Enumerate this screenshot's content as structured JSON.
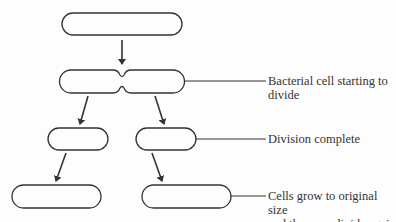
{
  "diagram": {
    "title": "",
    "stages": [
      {
        "id": "original-cell",
        "label": ""
      },
      {
        "id": "dividing-cell",
        "label": "Bacterial cell starting to divide"
      },
      {
        "id": "daughter-cells",
        "label": "Division complete"
      },
      {
        "id": "grown-cells",
        "label": "Cells grow to original size and then can divide again"
      }
    ],
    "labels": {
      "dividing_line1": "Bacterial cell starting to",
      "dividing_line2": "divide",
      "division_complete": "Division complete",
      "grown_line1": "Cells grow to original size",
      "grown_line2": "and then can divide again"
    },
    "colors": {
      "stroke": "#333333",
      "text": "#333333",
      "background": "#fdfdfd"
    }
  }
}
